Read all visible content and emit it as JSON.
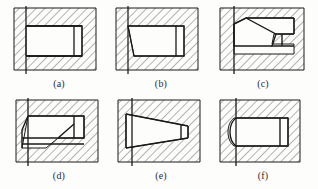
{
  "figure": {
    "kind": "engineering-section-views",
    "background_color": "#fdfdfc",
    "line_color": "#1a1a1a",
    "hatch_color": "#6e6e6e",
    "caption_color": "#2b2b2b",
    "width": 318,
    "height": 189,
    "columns": 3,
    "rows": 2
  },
  "panels": [
    {
      "id": "a",
      "caption": "(a)",
      "left": 6,
      "top": 4,
      "description": "Rectangular pocket with square left entry and plain rectangular step at right",
      "left_profile": "square",
      "right_profile": "straight-step",
      "vertical_datum_line": true
    },
    {
      "id": "b",
      "caption": "(b)",
      "left": 112,
      "top": 4,
      "description": "Pocket with chamfered lower-left corner and plain rectangular step at right",
      "left_profile": "chamfer-bottom",
      "right_profile": "straight-step",
      "vertical_datum_line": true
    },
    {
      "id": "c",
      "caption": "(c)",
      "left": 212,
      "top": 4,
      "description": "Pocket with double chamfer at left and stepped tapered notch at right",
      "left_profile": "double-chamfer",
      "right_profile": "stepped-taper",
      "vertical_datum_line": true
    },
    {
      "id": "d",
      "caption": "(d)",
      "left": 6,
      "top": 96,
      "description": "Pocket with chamfered lower-left corner and internal diagonal fillet at right",
      "left_profile": "chamfer-bottom",
      "right_profile": "diagonal-fillet",
      "vertical_datum_line": true
    },
    {
      "id": "e",
      "caption": "(e)",
      "left": 112,
      "top": 96,
      "description": "Wedge-shaped tapered pocket narrowing toward the right with narrow step",
      "left_profile": "square-wide",
      "right_profile": "tapered-narrow-step",
      "vertical_datum_line": true
    },
    {
      "id": "f",
      "caption": "(f)",
      "left": 212,
      "top": 96,
      "description": "Pocket with rounded convex left edge and plain rectangular step at right",
      "left_profile": "rounded",
      "right_profile": "straight-step",
      "vertical_datum_line": true
    }
  ],
  "captions": {
    "a": "(a)",
    "b": "(b)",
    "c": "(c)",
    "d": "(d)",
    "e": "(e)",
    "f": "(f)"
  }
}
